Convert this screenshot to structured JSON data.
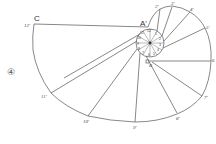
{
  "figure": {
    "step_label": "④",
    "points": {
      "A_prime": "A'",
      "B": "B",
      "C": "C"
    },
    "involute_labels": [
      "2'",
      "3'",
      "4'",
      "5'",
      "6",
      "7'",
      "8'",
      "9'",
      "10'",
      "11'",
      "12'"
    ],
    "circle_division_labels": [
      "1",
      "2",
      "3",
      "4",
      "5",
      "6",
      "7",
      "8",
      "9",
      "10",
      "11",
      "12"
    ],
    "colors": {
      "line": "#555555",
      "background": "#ffffff"
    }
  }
}
